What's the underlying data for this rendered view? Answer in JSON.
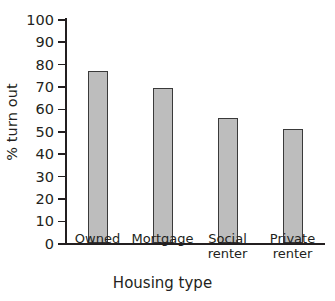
{
  "chart_data": {
    "type": "bar",
    "title": "",
    "categories": [
      "Owned",
      "Mortgage",
      "Social renter",
      "Private renter"
    ],
    "values": [
      77,
      69,
      56,
      51
    ],
    "xlabel": "Housing type",
    "ylabel": "% turn out",
    "ylim": [
      0,
      100
    ],
    "ytick_labels": [
      "100",
      "90",
      "80",
      "70",
      "60",
      "50",
      "40",
      "30",
      "20",
      "10",
      "0"
    ],
    "ytick_values": [
      100,
      90,
      80,
      70,
      60,
      50,
      40,
      30,
      20,
      10,
      0
    ],
    "grid": false,
    "legend": null,
    "bar_fill_color": "#bdbdbd",
    "bar_border_color": "#3a3a3a",
    "axis_color": "#231f20",
    "background_color": "#ffffff"
  },
  "axes": {
    "y_title": "% turn out",
    "x_title": "Housing type"
  },
  "ticks": {
    "y": [
      {
        "label": "100",
        "value": 100
      },
      {
        "label": "90",
        "value": 90
      },
      {
        "label": "80",
        "value": 80
      },
      {
        "label": "70",
        "value": 70
      },
      {
        "label": "60",
        "value": 60
      },
      {
        "label": "50",
        "value": 50
      },
      {
        "label": "40",
        "value": 40
      },
      {
        "label": "30",
        "value": 30
      },
      {
        "label": "20",
        "value": 20
      },
      {
        "label": "10",
        "value": 10
      },
      {
        "label": "0",
        "value": 0
      }
    ],
    "x": [
      {
        "label": "Owned"
      },
      {
        "label": "Mortgage"
      },
      {
        "label": "Social renter"
      },
      {
        "label": "Private\nrenter"
      }
    ]
  }
}
